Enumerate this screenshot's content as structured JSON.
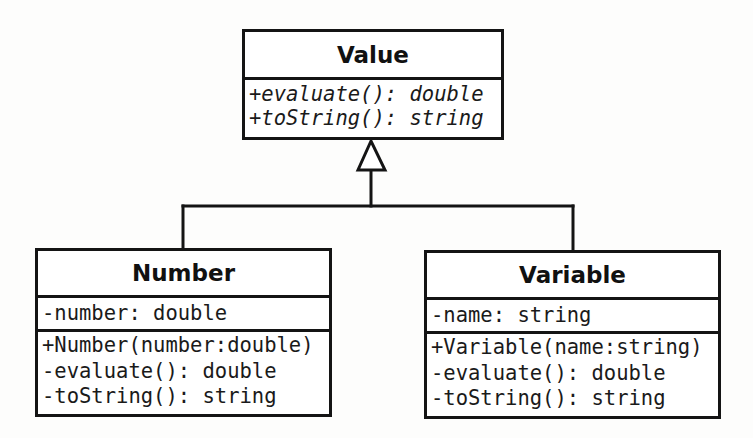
{
  "diagram": {
    "type": "uml-class-diagram",
    "relationship": "inheritance",
    "colors": {
      "line": "#141414",
      "background": "#ffffff",
      "text": "#111111"
    },
    "classes": {
      "value": {
        "name": "Value",
        "abstract": true,
        "attributes": [],
        "methods": [
          "+evaluate(): double",
          "+toString(): string"
        ]
      },
      "number": {
        "name": "Number",
        "attributes": [
          "-number: double"
        ],
        "methods": [
          "+Number(number:double)",
          "-evaluate(): double",
          "-toString(): string"
        ]
      },
      "variable": {
        "name": "Variable",
        "attributes": [
          "-name: string"
        ],
        "methods": [
          "+Variable(name:string)",
          "-evaluate(): double",
          "-toString(): string"
        ]
      }
    },
    "edges": [
      {
        "from": "Number",
        "to": "Value",
        "kind": "generalization"
      },
      {
        "from": "Variable",
        "to": "Value",
        "kind": "generalization"
      }
    ]
  }
}
